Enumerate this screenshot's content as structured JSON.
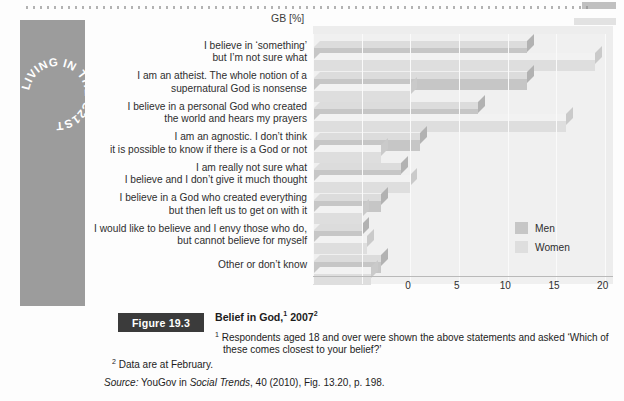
{
  "banner": {
    "text": "LIVING IN THE C21ST"
  },
  "chart_data": {
    "type": "bar",
    "orientation": "horizontal",
    "axis_title": "GB [%]",
    "xlabel": "",
    "ylabel": "",
    "xlim": [
      0,
      30
    ],
    "ticks": [
      "0",
      "5",
      "10",
      "15",
      "20",
      "25",
      "30"
    ],
    "grid": true,
    "legend_position": "inside-right",
    "categories": [
      "I believe in ‘something’\nbut I’m not sure what",
      "I am an atheist. The whole notion of a\nsupernatural God is nonsense",
      "I believe in a personal God who created\nthe world and hears my prayers",
      "I am an agnostic. I don’t think\nit is possible to know if there is a God or not",
      "I am really not sure what\nI believe and I don’t give it much thought",
      "I believe in a God who created everything\nbut then left us to get on with it",
      "I would like to believe and I envy those who do,\nbut cannot believe for myself",
      "Other or don’t know"
    ],
    "series": [
      {
        "name": "Men",
        "color": "#c6c6c6",
        "values": [
          22,
          22,
          17,
          11,
          9,
          7,
          5,
          7
        ]
      },
      {
        "name": "Women",
        "color": "#dedede",
        "values": [
          29,
          10,
          26,
          7,
          10,
          5,
          5.5,
          6
        ]
      }
    ]
  },
  "figure": {
    "tag": "Figure 19.3",
    "title_main": "Belief in God,",
    "title_sup1": "1",
    "title_year": "2007",
    "title_sup2": "2",
    "note1_marker": "1",
    "note1": "Respondents aged 18 and over were shown the above statements and asked ‘Which of these comes closest to your belief?’",
    "note2_marker": "2",
    "note2": "Data are at February.",
    "source_label": "Source:",
    "source_pre": " YouGov in ",
    "source_italic": "Social Trends",
    "source_post": ", 40 (2010), Fig. 13.20, p. 198."
  }
}
